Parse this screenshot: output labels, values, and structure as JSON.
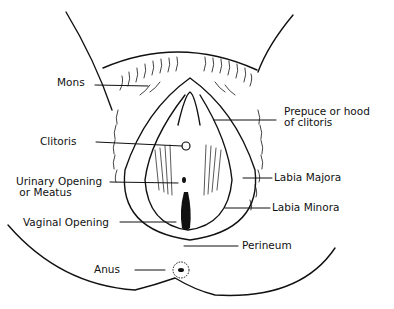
{
  "diagram": {
    "type": "anatomical line drawing",
    "line_color": "#111111",
    "background": "#ffffff",
    "labels": [
      {
        "id": "mons",
        "text": "Mons",
        "x": 57,
        "y": 82
      },
      {
        "id": "prepuce",
        "text": "Prepuce or hood\nof clitoris",
        "x": 284,
        "y": 109
      },
      {
        "id": "clitoris",
        "text": "Clitoris",
        "x": 40,
        "y": 138
      },
      {
        "id": "labia-majora",
        "text": "Labia Majora",
        "x": 274,
        "y": 172
      },
      {
        "id": "urinary",
        "text": "Urinary Opening\n or Meatus",
        "x": 16,
        "y": 179
      },
      {
        "id": "labia-minora",
        "text": "Labia Minora",
        "x": 272,
        "y": 202
      },
      {
        "id": "vaginal",
        "text": "Vaginal Opening",
        "x": 23,
        "y": 214
      },
      {
        "id": "perineum",
        "text": "Perineum",
        "x": 242,
        "y": 236
      },
      {
        "id": "anus",
        "text": "Anus",
        "x": 94,
        "y": 266
      }
    ]
  }
}
